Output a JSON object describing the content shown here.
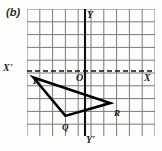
{
  "figure": {
    "caption": "(b)",
    "width": 162,
    "height": 151
  },
  "grid": {
    "columns": 10,
    "rows": 10,
    "cell_size": 12.8,
    "line_color": "#7a7a7a",
    "background": "#fdfdfb",
    "show": true
  },
  "axes": {
    "x_axis": {
      "label_positive": "X",
      "label_negative": "X'",
      "style": "dashed",
      "color": "#111111"
    },
    "y_axis": {
      "label_positive": "Y",
      "label_negative": "Y'",
      "style": "solid",
      "color": "#111111"
    },
    "origin_label": "O"
  },
  "chart_data": {
    "type": "scatter",
    "title": "(b)",
    "xlabel": "X",
    "ylabel": "Y",
    "xlim": [
      -5,
      5
    ],
    "ylim": [
      -5,
      5
    ],
    "grid": true,
    "shape": "triangle",
    "points": [
      {
        "name": "P",
        "x": -4,
        "y": -0.5
      },
      {
        "name": "Q",
        "x": -1.5,
        "y": -3.5
      },
      {
        "name": "R",
        "x": 2,
        "y": -2.5
      }
    ],
    "edges": [
      [
        "P",
        "Q"
      ],
      [
        "Q",
        "R"
      ],
      [
        "R",
        "P"
      ]
    ]
  },
  "vertices": {
    "p": "P",
    "q": "Q",
    "r": "R"
  },
  "colors": {
    "grid": "#7a7a7a",
    "axis": "#111111",
    "triangle": "#000000",
    "text": "#1c1c1c"
  }
}
